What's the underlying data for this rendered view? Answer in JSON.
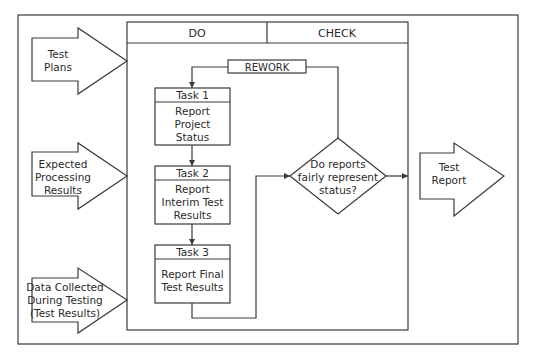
{
  "diagram": {
    "columns": {
      "do": "DO",
      "check": "CHECK"
    },
    "inputs": [
      {
        "lines": [
          "Test",
          "Plans"
        ]
      },
      {
        "lines": [
          "Expected",
          "Processing",
          "Results"
        ]
      },
      {
        "lines": [
          "Data Collected",
          "During Testing",
          "(Test Results)"
        ]
      }
    ],
    "rework_label": "REWORK",
    "tasks": [
      {
        "title": "Task 1",
        "lines": [
          "Report",
          "Project",
          "Status"
        ]
      },
      {
        "title": "Task 2",
        "lines": [
          "Report",
          "Interim Test",
          "Results"
        ]
      },
      {
        "title": "Task 3",
        "lines": [
          "Report Final",
          "Test Results"
        ]
      }
    ],
    "decision": {
      "lines": [
        "Do reports",
        "fairly represent",
        "status?"
      ]
    },
    "output": {
      "lines": [
        "Test",
        "Report"
      ]
    }
  }
}
